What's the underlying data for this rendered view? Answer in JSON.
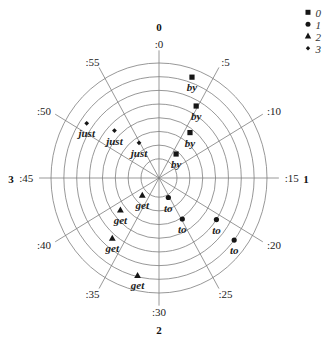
{
  "chart_data": {
    "type": "scatter",
    "coordinate_system": "polar",
    "title": "",
    "grid": true,
    "angular_axis": {
      "unit": "minutes",
      "range": [
        0,
        60
      ],
      "zero": "top",
      "direction": "clockwise",
      "ticks": [
        0,
        5,
        10,
        15,
        20,
        25,
        30,
        35,
        40,
        45,
        50,
        55
      ],
      "tick_labels": [
        ":0",
        ":5",
        ":10",
        ":15",
        ":20",
        ":25",
        ":30",
        ":35",
        ":40",
        ":45",
        ":50",
        ":55"
      ]
    },
    "radial_axis": {
      "range": [
        -0.4,
        8
      ],
      "rings": [
        1,
        2,
        3,
        4,
        5,
        6,
        7,
        8
      ],
      "tick_labels_shown": false
    },
    "quadrant_labels": {
      "top": "0",
      "right": "1",
      "bottom": "2",
      "left": "3"
    },
    "legend": {
      "position": "top-right",
      "entries": [
        {
          "label": "0",
          "marker": "square"
        },
        {
          "label": "1",
          "marker": "circle"
        },
        {
          "label": "2",
          "marker": "triangle"
        },
        {
          "label": "3",
          "marker": "diamond"
        }
      ]
    },
    "colors": {
      "marker": "#161616",
      "grid": "#7d7d7d"
    },
    "series": [
      {
        "name": "0",
        "marker": "square",
        "points": [
          {
            "theta": 3.2,
            "r": 7.4,
            "label": "by"
          },
          {
            "theta": 4.8,
            "r": 5.6,
            "label": "by"
          },
          {
            "theta": 6.0,
            "r": 3.7,
            "label": "by"
          },
          {
            "theta": 6.2,
            "r": 1.8,
            "label": "by"
          }
        ]
      },
      {
        "name": "1",
        "marker": "circle",
        "points": [
          {
            "theta": 25.5,
            "r": 1.2,
            "label": "to"
          },
          {
            "theta": 24.8,
            "r": 3.1,
            "label": "to"
          },
          {
            "theta": 20.7,
            "r": 5.0,
            "label": "to"
          },
          {
            "theta": 21.3,
            "r": 7.0,
            "label": "to"
          }
        ]
      },
      {
        "name": "2",
        "marker": "triangle",
        "points": [
          {
            "theta": 37.7,
            "r": 1.4,
            "label": "get"
          },
          {
            "theta": 38.7,
            "r": 3.4,
            "label": "get"
          },
          {
            "theta": 36.6,
            "r": 5.3,
            "label": "get"
          },
          {
            "theta": 32.2,
            "r": 6.9,
            "label": "get"
          }
        ]
      },
      {
        "name": "3",
        "marker": "diamond",
        "points": [
          {
            "theta": 50.9,
            "r": 6.5,
            "label": "just"
          },
          {
            "theta": 52.5,
            "r": 4.5,
            "label": "just"
          },
          {
            "theta": 54.8,
            "r": 2.6,
            "label": "just"
          }
        ]
      }
    ]
  }
}
